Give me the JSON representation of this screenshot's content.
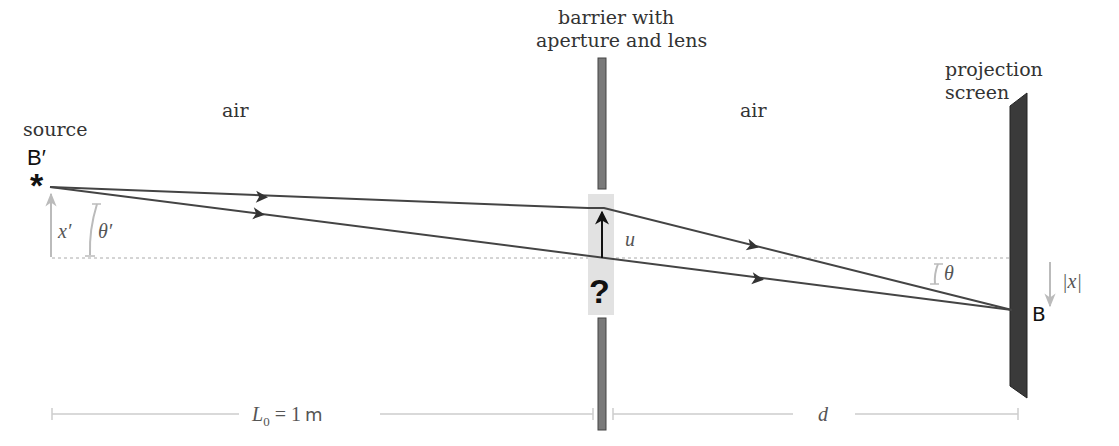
{
  "labels": {
    "source": "source",
    "source_point": "B′",
    "source_point_prime": "′",
    "air_left": "air",
    "air_right": "air",
    "barrier_line1": "barrier with",
    "barrier_line2": "aperture and lens",
    "screen_line1": "projection",
    "screen_line2": "screen",
    "image_point": "B",
    "unknown": "?"
  },
  "math": {
    "x_prime": "x′",
    "theta_prime": "θ′",
    "u": "u",
    "theta": "θ",
    "abs_x": "|x|",
    "L0_main": "L",
    "L0_sub": "0",
    "L0_rest": " = 1",
    "L0_unit": "m",
    "d": "d"
  },
  "colors": {
    "ray": "#444444",
    "barrier": "#777777",
    "screen": "#333333",
    "annotation": "#bbbbbb",
    "lens_box": "#e0e0e0",
    "axis": "#999999"
  }
}
